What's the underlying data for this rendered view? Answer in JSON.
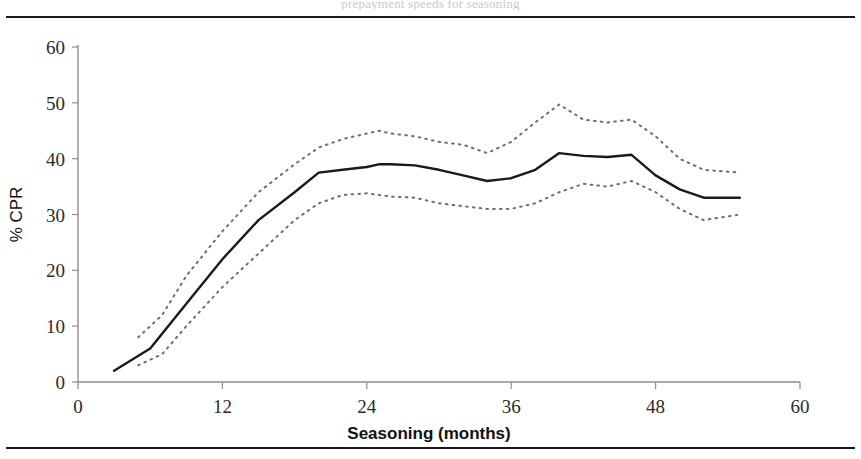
{
  "figure": {
    "top_caption_partial": "prepayment speeds for seasoning",
    "background": "#ffffff",
    "rule_color": "#1b1b1b"
  },
  "chart_data": {
    "type": "line",
    "title": "",
    "xlabel": "Seasoning (months)",
    "ylabel": "% CPR",
    "xlim": [
      0,
      60
    ],
    "ylim": [
      0,
      60
    ],
    "xticks": [
      0,
      12,
      24,
      36,
      48,
      60
    ],
    "yticks": [
      0,
      10,
      20,
      30,
      40,
      50,
      60
    ],
    "grid": false,
    "legend": "none",
    "series": [
      {
        "name": "CPR (mean)",
        "style": "solid",
        "color": "#1a1a1a",
        "x": [
          3,
          6,
          9,
          12,
          15,
          18,
          20,
          22,
          24,
          25,
          26,
          28,
          30,
          32,
          34,
          36,
          38,
          40,
          42,
          44,
          46,
          48,
          50,
          52,
          55
        ],
        "values": [
          2,
          6,
          14,
          22,
          29,
          34,
          37.5,
          38,
          38.5,
          39,
          39,
          38.8,
          38,
          37,
          36,
          36.5,
          38,
          41,
          40.5,
          40.3,
          40.7,
          37,
          34.5,
          33,
          33
        ]
      },
      {
        "name": "Upper confidence band",
        "style": "dotted",
        "color": "#6e6e72",
        "x": [
          5,
          7,
          9,
          12,
          15,
          18,
          20,
          22,
          24,
          25,
          26,
          28,
          30,
          32,
          34,
          36,
          38,
          40,
          42,
          44,
          46,
          48,
          50,
          52,
          55
        ],
        "values": [
          8,
          12,
          19,
          27,
          34,
          39,
          42,
          43.5,
          44.5,
          45,
          44.5,
          44,
          43,
          42.5,
          41,
          43,
          46.5,
          49.7,
          47,
          46.5,
          47,
          44,
          40,
          38,
          37.5
        ]
      },
      {
        "name": "Lower confidence band",
        "style": "dotted",
        "color": "#6e6e72",
        "x": [
          5,
          7,
          9,
          12,
          15,
          18,
          20,
          22,
          24,
          25,
          26,
          28,
          30,
          32,
          34,
          36,
          38,
          40,
          42,
          44,
          46,
          48,
          50,
          52,
          55
        ],
        "values": [
          3,
          5,
          10,
          17,
          23,
          29,
          32,
          33.5,
          33.8,
          33.5,
          33.2,
          33,
          32,
          31.5,
          31,
          31,
          32,
          34,
          35.5,
          35,
          36,
          34,
          31,
          29,
          30
        ]
      }
    ]
  }
}
